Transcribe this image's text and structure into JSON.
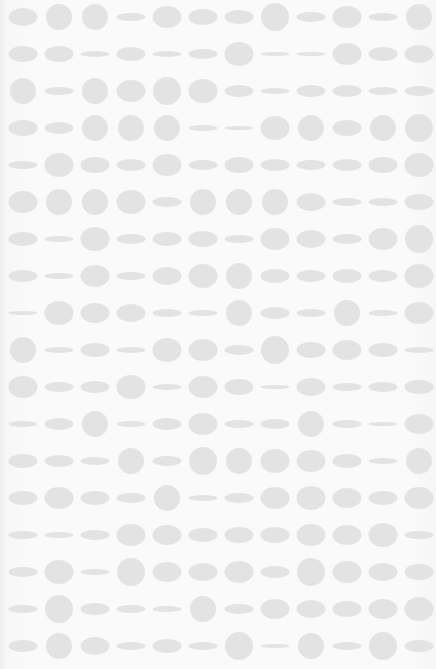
{
  "image": {
    "description": "Grid pattern of light gray ellipses and circles of varying heights on a white background",
    "background_color": "#fafafa",
    "dot_color": "#e3e3e3",
    "grid": {
      "rows": 18,
      "columns": 12,
      "origin_x": 23,
      "origin_y": 17,
      "spacing_x": 36,
      "spacing_y": 37,
      "dot_width": 29
    },
    "dot_heights": [
      [
        18,
        26,
        26,
        8,
        22,
        16,
        14,
        28,
        10,
        22,
        8,
        26
      ],
      [
        16,
        16,
        6,
        14,
        6,
        10,
        24,
        4,
        4,
        22,
        14,
        18
      ],
      [
        26,
        8,
        26,
        22,
        28,
        24,
        12,
        6,
        12,
        12,
        8,
        10
      ],
      [
        16,
        12,
        26,
        26,
        26,
        6,
        4,
        24,
        26,
        16,
        26,
        28
      ],
      [
        8,
        24,
        16,
        12,
        22,
        10,
        16,
        12,
        10,
        12,
        16,
        24
      ],
      [
        22,
        26,
        26,
        24,
        10,
        26,
        26,
        26,
        18,
        8,
        8,
        16
      ],
      [
        14,
        6,
        24,
        10,
        14,
        16,
        8,
        22,
        18,
        10,
        22,
        28
      ],
      [
        12,
        6,
        22,
        8,
        18,
        24,
        26,
        14,
        12,
        14,
        12,
        24
      ],
      [
        4,
        24,
        20,
        18,
        8,
        6,
        26,
        12,
        8,
        26,
        6,
        22
      ],
      [
        26,
        6,
        14,
        6,
        24,
        22,
        10,
        28,
        16,
        20,
        14,
        6
      ],
      [
        22,
        10,
        12,
        24,
        6,
        22,
        16,
        4,
        18,
        8,
        10,
        14
      ],
      [
        6,
        12,
        26,
        6,
        12,
        22,
        8,
        10,
        26,
        8,
        4,
        20
      ],
      [
        14,
        12,
        8,
        26,
        10,
        28,
        26,
        24,
        22,
        14,
        6,
        26
      ],
      [
        14,
        22,
        14,
        10,
        26,
        6,
        10,
        22,
        24,
        20,
        14,
        22
      ],
      [
        8,
        6,
        10,
        22,
        20,
        14,
        16,
        16,
        22,
        20,
        24,
        8
      ],
      [
        10,
        24,
        6,
        28,
        20,
        18,
        22,
        12,
        28,
        22,
        18,
        16
      ],
      [
        8,
        28,
        12,
        8,
        6,
        26,
        10,
        20,
        18,
        16,
        20,
        24
      ],
      [
        12,
        26,
        18,
        8,
        14,
        8,
        28,
        4,
        26,
        8,
        28,
        12
      ]
    ]
  }
}
